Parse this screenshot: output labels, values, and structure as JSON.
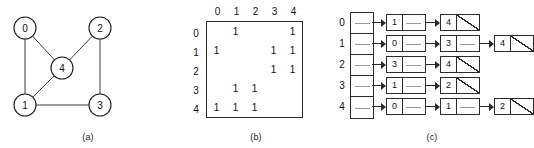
{
  "figure": {
    "panels": [
      {
        "id": "a",
        "caption": "(a)",
        "title": "undirected-graph"
      },
      {
        "id": "b",
        "caption": "(b)",
        "title": "adjacency-matrix"
      },
      {
        "id": "c",
        "caption": "(c)",
        "title": "adjacency-list"
      }
    ]
  },
  "graph": {
    "type": "undirected",
    "nodes": [
      {
        "id": "0",
        "label": "0",
        "cx": 25,
        "cy": 28
      },
      {
        "id": "1",
        "label": "1",
        "cx": 25,
        "cy": 105
      },
      {
        "id": "2",
        "label": "2",
        "cx": 100,
        "cy": 28
      },
      {
        "id": "3",
        "label": "3",
        "cx": 100,
        "cy": 105
      },
      {
        "id": "4",
        "label": "4",
        "cx": 62,
        "cy": 68
      }
    ],
    "radius": 11,
    "edges": [
      {
        "from": "0",
        "to": "1"
      },
      {
        "from": "0",
        "to": "4"
      },
      {
        "from": "1",
        "to": "3"
      },
      {
        "from": "1",
        "to": "4"
      },
      {
        "from": "2",
        "to": "3"
      },
      {
        "from": "2",
        "to": "4"
      }
    ]
  },
  "matrix": {
    "col_headers": [
      "0",
      "1",
      "2",
      "3",
      "4"
    ],
    "row_headers": [
      "0",
      "1",
      "2",
      "3",
      "4"
    ],
    "rows": [
      [
        "",
        "1",
        "",
        "",
        "1"
      ],
      [
        "1",
        "",
        "",
        "1",
        "1"
      ],
      [
        "",
        "",
        "",
        "1",
        "1"
      ],
      [
        "",
        "1",
        "1",
        "",
        ""
      ],
      [
        "1",
        "1",
        "1",
        "",
        ""
      ]
    ]
  },
  "adjacency_list": {
    "index_labels": [
      "0",
      "1",
      "2",
      "3",
      "4"
    ],
    "lists": [
      {
        "index": "0",
        "nodes": [
          "1",
          "4"
        ]
      },
      {
        "index": "1",
        "nodes": [
          "0",
          "3",
          "4"
        ]
      },
      {
        "index": "2",
        "nodes": [
          "3",
          "4"
        ]
      },
      {
        "index": "3",
        "nodes": [
          "1",
          "2"
        ]
      },
      {
        "index": "4",
        "nodes": [
          "0",
          "1",
          "2"
        ]
      }
    ]
  },
  "colors": {
    "ink": "#2b2b2b",
    "line": "#3c3c3c",
    "background": "#ffffff"
  }
}
